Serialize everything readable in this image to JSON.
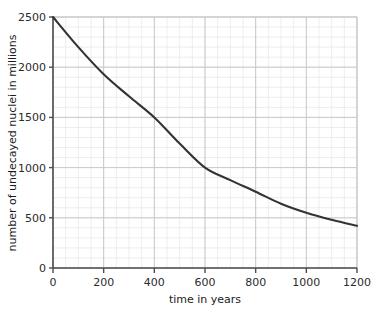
{
  "chart_data": {
    "type": "line",
    "title": "",
    "xlabel": "time in years",
    "ylabel": "number of undecayed nuclei in millions",
    "xlim": [
      0,
      1200
    ],
    "ylim": [
      0,
      2500
    ],
    "xticks": [
      0,
      200,
      400,
      600,
      800,
      1000,
      1200
    ],
    "yticks": [
      0,
      500,
      1000,
      1500,
      2000,
      2500
    ],
    "xtick_labels": [
      "0",
      "200",
      "400",
      "600",
      "800",
      "1000",
      "1200"
    ],
    "ytick_labels": [
      "0",
      "500",
      "1000",
      "1500",
      "2000",
      "2500"
    ],
    "grid": true,
    "minor_grid": true,
    "minor_grid_x_step": 50,
    "minor_grid_y_step": 100,
    "legend": false,
    "series": [
      {
        "name": "undecayed nuclei",
        "color": "#333333",
        "x": [
          0,
          50,
          100,
          150,
          200,
          250,
          300,
          350,
          400,
          450,
          500,
          550,
          600,
          650,
          700,
          750,
          800,
          850,
          900,
          950,
          1000,
          1050,
          1100,
          1150,
          1200
        ],
        "values": [
          2500,
          2350,
          2210,
          2080,
          1950,
          1835,
          1725,
          1620,
          1520,
          1430,
          1345,
          1265,
          1000,
          1120,
          1055,
          990,
          930,
          875,
          820,
          775,
          725,
          680,
          640,
          600,
          420
        ]
      }
    ],
    "curve_points": [
      {
        "x": 0,
        "y": 2500
      },
      {
        "x": 100,
        "y": 2200
      },
      {
        "x": 200,
        "y": 1930
      },
      {
        "x": 300,
        "y": 1710
      },
      {
        "x": 400,
        "y": 1500
      },
      {
        "x": 500,
        "y": 1240
      },
      {
        "x": 600,
        "y": 1000
      },
      {
        "x": 700,
        "y": 875
      },
      {
        "x": 800,
        "y": 760
      },
      {
        "x": 900,
        "y": 640
      },
      {
        "x": 1000,
        "y": 550
      },
      {
        "x": 1100,
        "y": 480
      },
      {
        "x": 1200,
        "y": 420
      }
    ],
    "colors": {
      "curve": "#333333",
      "axis": "#4d4d4d",
      "major_grid": "#c9c9c9",
      "minor_grid": "#e8e8e8",
      "background": "#ffffff",
      "text": "#2b2b2b"
    }
  }
}
